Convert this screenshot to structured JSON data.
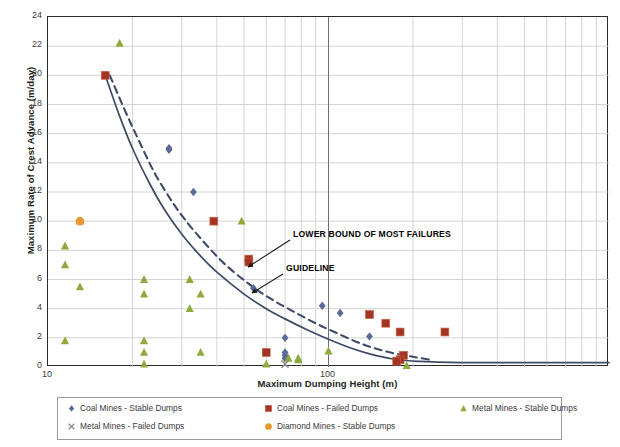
{
  "chart_data": {
    "type": "scatter",
    "title": "",
    "xlabel": "Maximum Dumping Height (m)",
    "ylabel": "Maximum Rate of Crest Advance (m/day)",
    "xscale": "log",
    "xlim": [
      10,
      1000
    ],
    "ylim": [
      0,
      24
    ],
    "yticks": [
      0,
      2,
      4,
      6,
      8,
      10,
      12,
      14,
      16,
      18,
      20,
      22,
      24
    ],
    "xticks": [
      10,
      100
    ],
    "xticklabels": [
      "10",
      "100"
    ],
    "grid": true,
    "legend_position": "bottom",
    "colors": {
      "coal_stable": "#5b6a96",
      "coal_failed": "#a33322",
      "metal_stable": "#8faa3c",
      "metal_failed": "#8e8e8e",
      "diamond_stable": "#e8972e",
      "curve": "#3e4a66",
      "grid": "#c9c9c9",
      "axis": "#2b2b2b"
    },
    "series": [
      {
        "name": "Coal Mines - Stable Dumps",
        "marker": "diamond",
        "color": "#5b6a96",
        "points": [
          [
            27,
            15.0
          ],
          [
            27,
            14.9
          ],
          [
            33,
            12.0
          ],
          [
            54,
            5.4
          ],
          [
            70,
            2.0
          ],
          [
            70,
            1.0
          ],
          [
            70,
            0.8
          ],
          [
            70,
            0.6
          ],
          [
            95,
            4.2
          ],
          [
            110,
            3.7
          ],
          [
            140,
            2.1
          ]
        ]
      },
      {
        "name": "Coal Mines - Failed Dumps",
        "marker": "square",
        "color": "#a33322",
        "points": [
          [
            16,
            20.0
          ],
          [
            39,
            10.0
          ],
          [
            52,
            7.4
          ],
          [
            52,
            7.2
          ],
          [
            60,
            1.0
          ],
          [
            140,
            3.6
          ],
          [
            160,
            3.0
          ],
          [
            180,
            2.4
          ],
          [
            185,
            0.8
          ],
          [
            180,
            0.5
          ],
          [
            175,
            0.4
          ],
          [
            260,
            2.4
          ]
        ]
      },
      {
        "name": "Metal Mines - Stable Dumps",
        "marker": "triangle",
        "color": "#8faa3c",
        "points": [
          [
            18,
            22.2
          ],
          [
            13,
            10.0
          ],
          [
            11.5,
            8.3
          ],
          [
            11.5,
            7.0
          ],
          [
            13,
            5.5
          ],
          [
            11.5,
            1.8
          ],
          [
            22,
            6.0
          ],
          [
            22,
            5.0
          ],
          [
            22,
            1.8
          ],
          [
            22,
            1.0
          ],
          [
            22,
            0.2
          ],
          [
            32,
            6.0
          ],
          [
            32,
            4.0
          ],
          [
            35,
            5.0
          ],
          [
            35,
            1.0
          ],
          [
            49,
            10.0
          ],
          [
            60,
            0.2
          ],
          [
            72,
            0.6
          ],
          [
            78,
            0.6
          ],
          [
            78,
            0.5
          ],
          [
            100,
            1.1
          ],
          [
            190,
            0.1
          ]
        ]
      },
      {
        "name": "Metal Mines - Failed Dumps",
        "marker": "cross",
        "color": "#8e8e8e",
        "points": [
          [
            70,
            0.2
          ]
        ]
      },
      {
        "name": "Diamond Mines - Stable Dumps",
        "marker": "circle",
        "color": "#e8972e",
        "points": [
          [
            13,
            10.0
          ]
        ]
      }
    ],
    "curves": [
      {
        "name": "GUIDELINE",
        "style": "solid",
        "color": "#3e4a66",
        "points": [
          [
            16,
            20.0
          ],
          [
            18,
            17.2
          ],
          [
            20,
            15.0
          ],
          [
            23,
            12.6
          ],
          [
            26,
            10.8
          ],
          [
            30,
            9.1
          ],
          [
            35,
            7.6
          ],
          [
            40,
            6.5
          ],
          [
            50,
            5.0
          ],
          [
            60,
            4.0
          ],
          [
            70,
            3.3
          ],
          [
            85,
            2.5
          ],
          [
            100,
            1.9
          ],
          [
            120,
            1.3
          ],
          [
            140,
            0.9
          ],
          [
            170,
            0.55
          ],
          [
            210,
            0.38
          ],
          [
            300,
            0.3
          ],
          [
            450,
            0.3
          ],
          [
            700,
            0.3
          ],
          [
            1000,
            0.3
          ]
        ]
      },
      {
        "name": "LOWER BOUND OF MOST FAILURES",
        "style": "dashed",
        "color": "#3e4a66",
        "points": [
          [
            16.6,
            20.0
          ],
          [
            19,
            17.4
          ],
          [
            21,
            15.6
          ],
          [
            24,
            13.3
          ],
          [
            28,
            11.2
          ],
          [
            32,
            9.7
          ],
          [
            37,
            8.3
          ],
          [
            43,
            7.0
          ],
          [
            52,
            5.7
          ],
          [
            62,
            4.7
          ],
          [
            75,
            3.8
          ],
          [
            90,
            3.0
          ],
          [
            105,
            2.4
          ],
          [
            125,
            1.75
          ],
          [
            145,
            1.3
          ],
          [
            170,
            0.95
          ],
          [
            200,
            0.7
          ],
          [
            230,
            0.5
          ]
        ]
      }
    ],
    "annotations": [
      {
        "text": "LOWER BOUND OF MOST FAILURES",
        "label_x": 293,
        "label_y": 229,
        "arrow_from_x": 290,
        "arrow_from_y": 240,
        "arrow_to_x": 248,
        "arrow_to_y": 267
      },
      {
        "text": "GUIDELINE",
        "label_x": 286,
        "label_y": 263,
        "arrow_from_x": 283,
        "arrow_from_y": 274,
        "arrow_to_x": 252,
        "arrow_to_y": 293
      }
    ]
  },
  "legend": {
    "items": [
      {
        "label": "Coal Mines - Stable Dumps",
        "marker": "diamond",
        "color": "#5b6a96"
      },
      {
        "label": "Coal Mines - Failed Dumps",
        "marker": "square",
        "color": "#a33322"
      },
      {
        "label": "Metal Mines - Stable Dumps",
        "marker": "triangle",
        "color": "#8faa3c"
      },
      {
        "label": "Metal Mines - Failed Dumps",
        "marker": "cross",
        "color": "#8e8e8e"
      },
      {
        "label": "Diamond Mines - Stable Dumps",
        "marker": "circle",
        "color": "#e8972e"
      }
    ]
  }
}
